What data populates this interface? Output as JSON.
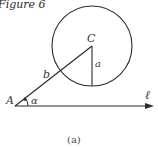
{
  "figure": {
    "title": "Figure 6",
    "caption": "(a)"
  },
  "labels": {
    "vertex_a": "A",
    "center": "C",
    "side_b": "b",
    "side_a": "a",
    "angle": "α",
    "line": "ℓ"
  },
  "geometry": {
    "point_A": [
      15,
      106
    ],
    "point_C": [
      92,
      46
    ],
    "circle_radius": 40,
    "foot_of_perpendicular": [
      92,
      86
    ],
    "line_end": [
      153,
      106
    ]
  },
  "colors": {
    "stroke": "#2b2b2b",
    "text": "#3a3a3a"
  }
}
